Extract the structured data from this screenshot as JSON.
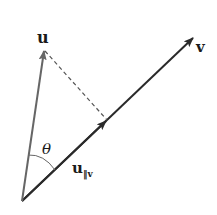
{
  "diagram": {
    "labels": {
      "u": "u",
      "v": "v",
      "theta": "θ",
      "u_par_main": "u",
      "u_par_sub": "‖v"
    },
    "colors": {
      "u_vector": "#666666",
      "v_vector": "#2a2a2a",
      "dashed": "#555555",
      "arc": "#666666",
      "text": "#1a1a1a"
    },
    "points": {
      "origin": [
        22,
        201
      ],
      "u_tip": [
        44,
        50
      ],
      "v_tip": [
        194,
        37
      ],
      "projection_foot": [
        107,
        120
      ]
    }
  }
}
